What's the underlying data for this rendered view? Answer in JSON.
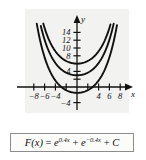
{
  "figure": {
    "name": "antiderivative-family-graph",
    "background_color": "#ffffff",
    "plot_background_color": "#f2f2f0",
    "curve_color": "#111111",
    "axis_color": "#111111",
    "border_color": "#8c8c8c",
    "top_watermark": "···"
  },
  "formula": {
    "lhs": "F(x)",
    "equals": "=",
    "term1_base": "e",
    "term1_exp": "0.4x",
    "plus1": "+",
    "term2_base": "e",
    "term2_exp": "−0.4x",
    "plus2": "+",
    "constant": "C",
    "full_text": "F(x) = e^{0.4x} + e^{−0.4x} + C"
  },
  "chart_data": {
    "type": "line",
    "title": "",
    "subtitle": "",
    "xlabel": "x",
    "ylabel": "y",
    "xlim": [
      -9.6,
      9.6
    ],
    "ylim": [
      -5.2,
      16.0
    ],
    "grid": false,
    "legend": "none",
    "x_ticks": [
      -8,
      -6,
      -4,
      -2,
      2,
      4,
      6,
      8
    ],
    "x_tick_labels": [
      "−8",
      "−6",
      "−4",
      "",
      "",
      "4",
      "6",
      "8"
    ],
    "y_ticks": [
      -4,
      2,
      4,
      6,
      8,
      10,
      12,
      14
    ],
    "y_tick_labels": [
      "−4",
      "",
      "4",
      "",
      "8",
      "10",
      "12",
      "14"
    ],
    "function_base": "e^{0.4x} + e^{-0.4x}",
    "series": [
      {
        "name": "C = 4",
        "C": 4,
        "vertex": [
          0,
          6
        ],
        "color": "#111111"
      },
      {
        "name": "C = 1",
        "C": 1,
        "vertex": [
          0,
          3
        ],
        "color": "#111111"
      },
      {
        "name": "C = -3.5",
        "C": -3.5,
        "vertex": [
          0,
          -1.5
        ],
        "color": "#111111"
      }
    ],
    "annotations": []
  }
}
